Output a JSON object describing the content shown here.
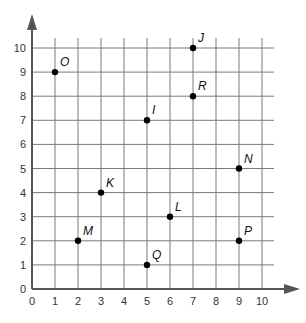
{
  "chart_data": {
    "type": "scatter",
    "title": "",
    "xlabel": "",
    "ylabel": "",
    "xlim": [
      0,
      10
    ],
    "ylim": [
      0,
      10
    ],
    "grid": true,
    "x_ticks": [
      "0",
      "1",
      "2",
      "3",
      "4",
      "5",
      "6",
      "7",
      "8",
      "9",
      "10"
    ],
    "y_ticks": [
      "0",
      "1",
      "2",
      "3",
      "4",
      "5",
      "6",
      "7",
      "8",
      "9",
      "10"
    ],
    "points": [
      {
        "label": "O",
        "x": 1,
        "y": 9
      },
      {
        "label": "J",
        "x": 7,
        "y": 10
      },
      {
        "label": "R",
        "x": 7,
        "y": 8
      },
      {
        "label": "I",
        "x": 5,
        "y": 7
      },
      {
        "label": "N",
        "x": 9,
        "y": 5
      },
      {
        "label": "K",
        "x": 3,
        "y": 4
      },
      {
        "label": "L",
        "x": 6,
        "y": 3
      },
      {
        "label": "M",
        "x": 2,
        "y": 2
      },
      {
        "label": "P",
        "x": 9,
        "y": 2
      },
      {
        "label": "Q",
        "x": 5,
        "y": 1
      }
    ]
  },
  "colors": {
    "grid": "#7a7a7a",
    "axis": "#555555",
    "point": "#000000"
  }
}
